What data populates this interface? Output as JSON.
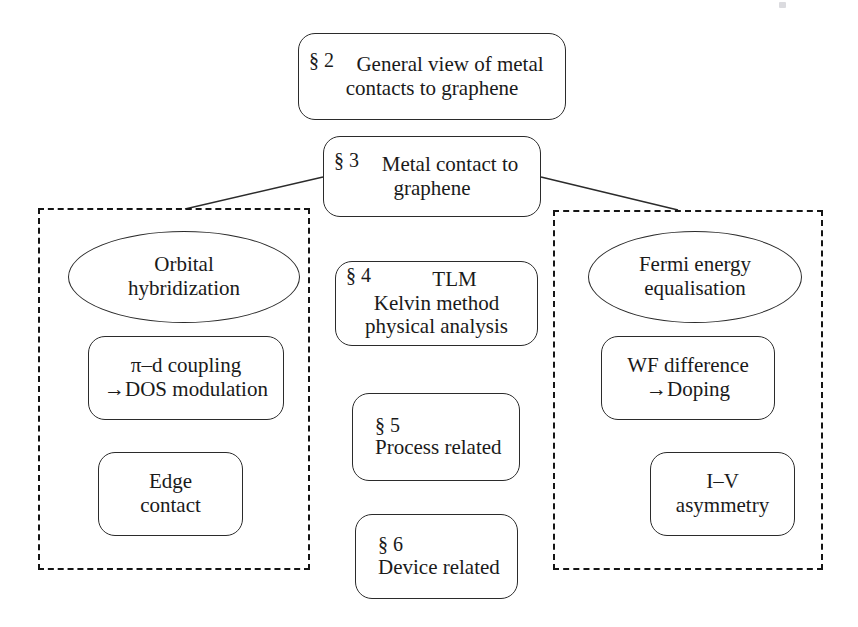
{
  "diagram": {
    "nodes": {
      "sect2": {
        "section": "§ 2",
        "line1": "General view of metal",
        "line2": "contacts to graphene"
      },
      "sect3": {
        "section": "§ 3",
        "line1": "Metal contact to",
        "line2": "graphene"
      },
      "orbital": {
        "line1": "Orbital",
        "line2": "hybridization"
      },
      "pid": {
        "line1": "π–d coupling",
        "line2": "→DOS modulation"
      },
      "edge": {
        "line1": "Edge",
        "line2": "contact"
      },
      "tlm": {
        "section": "§ 4",
        "line1": "TLM",
        "line2": "Kelvin method",
        "line3": "physical analysis"
      },
      "process": {
        "section": "§ 5",
        "line1": "Process related"
      },
      "device": {
        "section": "§ 6",
        "line1": "Device related"
      },
      "fermi": {
        "line1": "Fermi energy",
        "line2": "equalisation"
      },
      "wf": {
        "line1": "WF difference",
        "line2": "→Doping"
      },
      "iv": {
        "line1": "I–V",
        "line2": "asymmetry"
      }
    },
    "groups": {
      "left": {
        "name": "orbital-hybridization-group"
      },
      "right": {
        "name": "fermi-energy-equalisation-group"
      }
    },
    "colors": {
      "stroke": "#2b2b2b",
      "dashed_stroke": "#151515",
      "background": "#ffffff",
      "text": "#1a1a1a"
    }
  }
}
